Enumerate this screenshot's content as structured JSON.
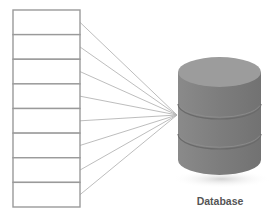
{
  "diagram": {
    "title": "",
    "table": {
      "row_count": 8,
      "x": 13,
      "y": 10,
      "width": 67,
      "height": 197,
      "border_color": "#9a9a9a",
      "rows": [
        {},
        {},
        {},
        {},
        {},
        {},
        {},
        {}
      ]
    },
    "connectors": {
      "count": 8,
      "target_x": 177,
      "target_y": 115,
      "color": "#b5b5b5"
    },
    "database": {
      "label": "Database",
      "icon": "database-cylinder-icon",
      "cx": 219.5,
      "rx": 41.5,
      "ry": 15,
      "top_y": 72,
      "bottom_y": 160,
      "segment_lines_y": [
        104,
        134
      ],
      "colors": {
        "top": "#9c9c9c",
        "body": "#7e7e7e",
        "edge": "#6a6a6a",
        "shadow": "#d6d6d6"
      }
    }
  }
}
